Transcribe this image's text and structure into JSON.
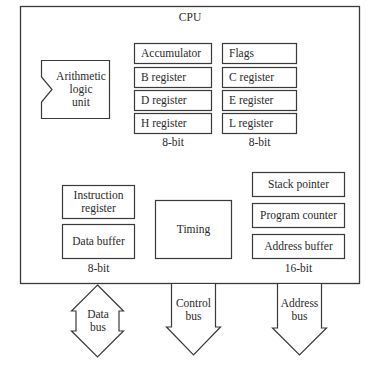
{
  "diagram": {
    "title": "CPU",
    "alu": {
      "label_lines": [
        "Arithmetic",
        "logic",
        "unit"
      ]
    },
    "register_file": {
      "left_column": [
        "Accumulator",
        "B register",
        "D register",
        "H register"
      ],
      "right_column": [
        "Flags",
        "C register",
        "E register",
        "L register"
      ],
      "left_width_label": "8-bit",
      "right_width_label": "8-bit"
    },
    "data_section": {
      "boxes": [
        {
          "label_lines": [
            "Instruction",
            "register"
          ]
        },
        {
          "label_lines": [
            "Data buffer"
          ]
        }
      ],
      "width_label": "8-bit"
    },
    "timing": {
      "label": "Timing"
    },
    "address_section": {
      "boxes": [
        "Stack pointer",
        "Program counter",
        "Address buffer"
      ],
      "width_label": "16-bit"
    },
    "buses": [
      {
        "label_lines": [
          "Data",
          "bus"
        ],
        "direction": "bidirectional"
      },
      {
        "label_lines": [
          "Control",
          "bus"
        ],
        "direction": "outbound"
      },
      {
        "label_lines": [
          "Address",
          "bus"
        ],
        "direction": "outbound"
      }
    ]
  }
}
